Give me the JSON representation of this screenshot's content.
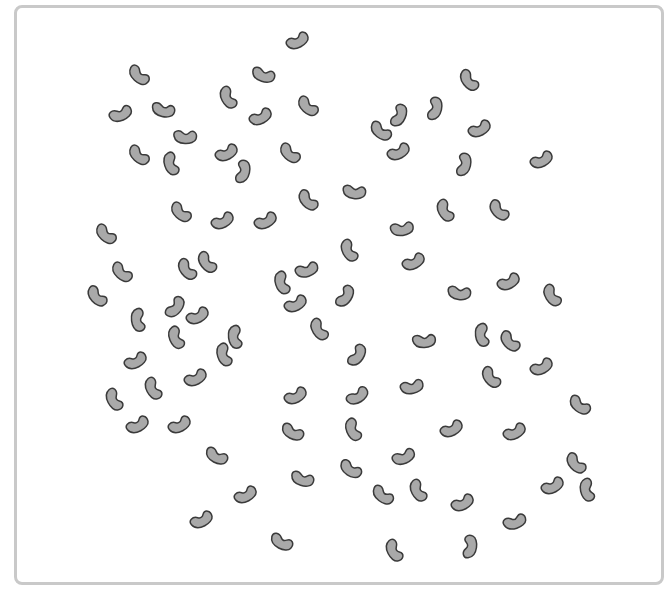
{
  "scene": {
    "description": "Scattered gray beans inside a rounded frame",
    "bean_fill": "#a9a9a9",
    "bean_stroke": "#3a3a3a",
    "frame_color": "#c9c9c9",
    "bean_count": 99
  },
  "beans": [
    [
      298,
      42,
      -30
    ],
    [
      138,
      76,
      40
    ],
    [
      263,
      76,
      15
    ],
    [
      468,
      81,
      50
    ],
    [
      121,
      115,
      -25
    ],
    [
      163,
      111,
      10
    ],
    [
      227,
      98,
      60
    ],
    [
      261,
      118,
      -30
    ],
    [
      307,
      107,
      40
    ],
    [
      400,
      116,
      -70
    ],
    [
      436,
      109,
      -80
    ],
    [
      380,
      132,
      35
    ],
    [
      480,
      130,
      -30
    ],
    [
      185,
      138,
      0
    ],
    [
      138,
      156,
      40
    ],
    [
      170,
      164,
      70
    ],
    [
      227,
      154,
      -30
    ],
    [
      244,
      172,
      -80
    ],
    [
      289,
      154,
      40
    ],
    [
      399,
      153,
      -30
    ],
    [
      465,
      165,
      -80
    ],
    [
      542,
      161,
      -30
    ],
    [
      180,
      213,
      40
    ],
    [
      223,
      222,
      -30
    ],
    [
      266,
      222,
      -30
    ],
    [
      307,
      201,
      45
    ],
    [
      354,
      193,
      5
    ],
    [
      444,
      211,
      60
    ],
    [
      498,
      211,
      45
    ],
    [
      105,
      235,
      40
    ],
    [
      402,
      230,
      -10
    ],
    [
      414,
      263,
      -30
    ],
    [
      121,
      273,
      40
    ],
    [
      186,
      270,
      50
    ],
    [
      206,
      263,
      50
    ],
    [
      281,
      283,
      70
    ],
    [
      307,
      271,
      -20
    ],
    [
      348,
      251,
      60
    ],
    [
      346,
      297,
      -60
    ],
    [
      96,
      297,
      45
    ],
    [
      459,
      294,
      5
    ],
    [
      509,
      283,
      -30
    ],
    [
      551,
      296,
      55
    ],
    [
      137,
      320,
      80
    ],
    [
      176,
      308,
      -55
    ],
    [
      198,
      317,
      -30
    ],
    [
      175,
      338,
      65
    ],
    [
      234,
      337,
      80
    ],
    [
      223,
      355,
      70
    ],
    [
      296,
      305,
      -30
    ],
    [
      318,
      330,
      55
    ],
    [
      136,
      362,
      -30
    ],
    [
      152,
      389,
      60
    ],
    [
      196,
      379,
      -30
    ],
    [
      113,
      400,
      60
    ],
    [
      358,
      356,
      -60
    ],
    [
      424,
      342,
      -5
    ],
    [
      481,
      335,
      80
    ],
    [
      509,
      342,
      45
    ],
    [
      490,
      378,
      50
    ],
    [
      542,
      368,
      -30
    ],
    [
      296,
      397,
      -30
    ],
    [
      358,
      397,
      -35
    ],
    [
      412,
      388,
      -15
    ],
    [
      579,
      406,
      35
    ],
    [
      138,
      426,
      -30
    ],
    [
      180,
      426,
      -30
    ],
    [
      292,
      433,
      25
    ],
    [
      352,
      430,
      65
    ],
    [
      452,
      430,
      -30
    ],
    [
      515,
      433,
      -30
    ],
    [
      216,
      457,
      25
    ],
    [
      350,
      470,
      30
    ],
    [
      404,
      458,
      -25
    ],
    [
      575,
      464,
      45
    ],
    [
      302,
      480,
      15
    ],
    [
      246,
      496,
      -30
    ],
    [
      382,
      496,
      35
    ],
    [
      417,
      491,
      60
    ],
    [
      463,
      504,
      -30
    ],
    [
      553,
      487,
      -30
    ],
    [
      586,
      490,
      75
    ],
    [
      202,
      521,
      -30
    ],
    [
      281,
      543,
      25
    ],
    [
      393,
      551,
      60
    ],
    [
      471,
      547,
      -85
    ],
    [
      515,
      523,
      -20
    ]
  ]
}
